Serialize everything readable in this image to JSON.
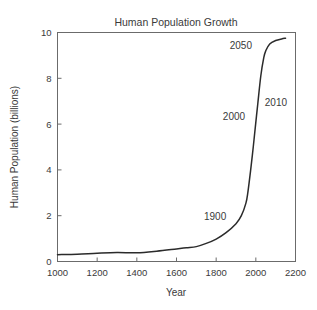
{
  "chart_data": {
    "type": "line",
    "title": "Human Population Growth",
    "xlabel": "Year",
    "ylabel": "Human Population (billions)",
    "xlim": [
      1000,
      2200
    ],
    "ylim": [
      0,
      10
    ],
    "grid": false,
    "legend": "none",
    "x_ticks": [
      1000,
      1200,
      1400,
      1600,
      1800,
      2000,
      2200
    ],
    "x_tick_labels": [
      "1000",
      "1200",
      "1400",
      "1600",
      "1800",
      "2000",
      "2200"
    ],
    "y_ticks": [
      0,
      2,
      4,
      6,
      8,
      10
    ],
    "y_tick_labels": [
      "0",
      "2",
      "4",
      "6",
      "8",
      "10"
    ],
    "series": [
      {
        "name": "Human Population",
        "x": [
          1000,
          1100,
          1200,
          1300,
          1400,
          1500,
          1600,
          1650,
          1700,
          1750,
          1800,
          1850,
          1900,
          1927,
          1950,
          1960,
          1974,
          1987,
          1999,
          2010,
          2025,
          2040,
          2050,
          2070,
          2100,
          2130,
          2150
        ],
        "values": [
          0.3,
          0.32,
          0.36,
          0.39,
          0.38,
          0.45,
          0.55,
          0.6,
          0.65,
          0.79,
          0.98,
          1.26,
          1.65,
          2.0,
          2.55,
          3.03,
          4.0,
          5.0,
          6.0,
          6.9,
          8.1,
          8.9,
          9.2,
          9.5,
          9.65,
          9.72,
          9.75
        ]
      }
    ],
    "annotations": [
      {
        "label": "1900",
        "x": 1900,
        "y": 1.65
      },
      {
        "label": "2000",
        "x": 2000,
        "y": 6.1
      },
      {
        "label": "2010",
        "x": 2010,
        "y": 6.9
      },
      {
        "label": "2050",
        "x": 2050,
        "y": 9.2
      }
    ]
  },
  "colors": {
    "background": "#ffffff",
    "curve": "#2b2b2b",
    "axis": "#6b6b6b",
    "text": "#3a3a3a"
  }
}
